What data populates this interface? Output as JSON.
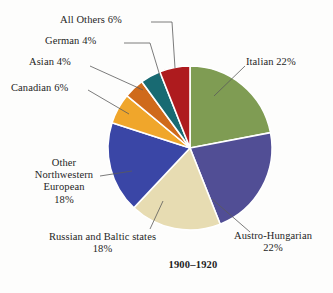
{
  "background_color": "#fdfdfc",
  "chart_data": {
    "type": "pie",
    "title": "1900–1920",
    "xlabel": "",
    "ylabel": "",
    "legend_position": "none",
    "grid": false,
    "start_angle_deg": 0,
    "direction": "clockwise",
    "center": {
      "x": 190,
      "y": 148
    },
    "radius": 82,
    "categories": [
      "Italian",
      "Austro-Hungarian",
      "Russian and Baltic states",
      "Other Northwestern European",
      "Canadian",
      "Asian",
      "German",
      "All Others"
    ],
    "values": [
      22,
      22,
      18,
      18,
      6,
      4,
      4,
      6
    ],
    "value_suffix": "%",
    "colors": [
      "#7f9c53",
      "#514e95",
      "#e7dcb2",
      "#3a46a6",
      "#f0a62b",
      "#cf6a1b",
      "#186a72",
      "#ae1b1e"
    ],
    "slice_border_color": "#ffffff",
    "slices": [
      {
        "name": "Italian",
        "value": 22,
        "color": "#7f9c53",
        "label": "Italian 22%"
      },
      {
        "name": "Austro-Hungarian",
        "value": 22,
        "color": "#514e95",
        "label": "Austro-Hungarian 22%"
      },
      {
        "name": "Russian and Baltic states",
        "value": 18,
        "color": "#e7dcb2",
        "label": "Russian and Baltic states 18%"
      },
      {
        "name": "Other Northwestern European",
        "value": 18,
        "color": "#3a46a6",
        "label": "Other Northwestern European 18%"
      },
      {
        "name": "Canadian",
        "value": 6,
        "color": "#f0a62b",
        "label": "Canadian 6%"
      },
      {
        "name": "Asian",
        "value": 4,
        "color": "#cf6a1b",
        "label": "Asian 4%"
      },
      {
        "name": "German",
        "value": 4,
        "color": "#186a72",
        "label": "German 4%"
      },
      {
        "name": "All Others",
        "value": 6,
        "color": "#ae1b1e",
        "label": "All Others 6%"
      }
    ]
  },
  "labels": {
    "italian": "Italian 22%",
    "austro_hungarian_line1": "Austro-Hungarian",
    "austro_hungarian_line2": "22%",
    "russian_line1": "Russian and Baltic states",
    "russian_line2": "18%",
    "other_nw_european_line1": "Other",
    "other_nw_european_line2": "Northwestern",
    "other_nw_european_line3": "European",
    "other_nw_european_line4": "18%",
    "canadian": "Canadian 6%",
    "asian": "Asian 4%",
    "german": "German 4%",
    "all_others": "All Others 6%"
  },
  "title": "1900–1920",
  "leader_line_color": "#5a5a5a"
}
